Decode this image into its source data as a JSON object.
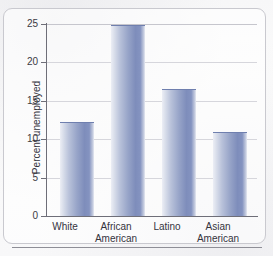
{
  "chart_data": {
    "type": "bar",
    "title": "",
    "xlabel": "",
    "ylabel": "Percent unemployed",
    "categories": [
      "White",
      "African American",
      "Latino",
      "Asian American"
    ],
    "category_lines": [
      [
        "White",
        ""
      ],
      [
        "African",
        "American"
      ],
      [
        "Latino",
        ""
      ],
      [
        "Asian",
        "American"
      ]
    ],
    "values": [
      12.1,
      24.8,
      16.4,
      10.8
    ],
    "ylim": [
      0,
      25
    ],
    "yticks": [
      0,
      5,
      10,
      15,
      20,
      25
    ],
    "ytick_labels": [
      "0",
      "5",
      "10",
      "15",
      "20",
      "25"
    ],
    "grid": true,
    "legend": "none",
    "bar_color": "#8c9bc4",
    "gridline_color": "#d6d6dc",
    "axis_color": "#6e6e78",
    "text_color": "#34343d",
    "background_color": "#f9f9fa"
  }
}
